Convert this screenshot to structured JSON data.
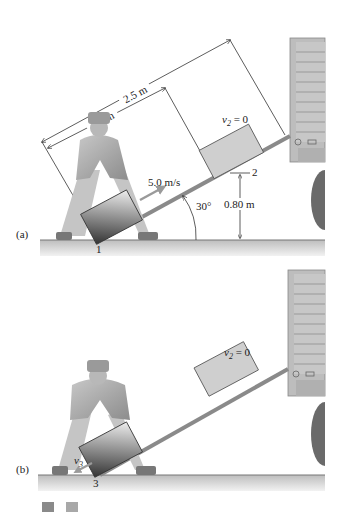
{
  "figure": {
    "panels": [
      {
        "id": "a",
        "label": "(a)",
        "point_label": "1",
        "speed_label": "5.0 m/s",
        "top_box_label": "v",
        "top_box_sub": "2",
        "top_box_eq": " = 0",
        "height_marker": "2",
        "height_label": "0.80 m",
        "angle_label": "30°",
        "dim_long": "2.5 m",
        "dim_short": "1.6 m"
      },
      {
        "id": "b",
        "label": "(b)",
        "point_label": "3",
        "velocity_label": "v",
        "velocity_sub": "3",
        "top_box_label": "v",
        "top_box_sub": "2",
        "top_box_eq": " = 0"
      }
    ],
    "colors": {
      "ramp": "#8a8a8a",
      "ground": "#d9d9d9",
      "box_light": "#cfcfcf",
      "box_dark": "#555555",
      "truck": "#bdbdbd",
      "wheel": "#6a6a6a",
      "worker": "#a9a9a9",
      "arrow": "#9a9a9a",
      "line": "#333333"
    }
  }
}
